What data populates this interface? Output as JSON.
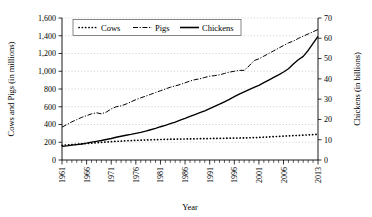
{
  "chart_data": {
    "type": "line",
    "title": "",
    "xlabel": "Year",
    "ylabel": "Cows and Pigs (in millions)",
    "y2label": "Chickens (in billions)",
    "xlim": [
      1961,
      2013
    ],
    "ylim": [
      0,
      1600
    ],
    "y2lim": [
      0,
      70
    ],
    "grid": true,
    "legend_position": "top-center-inside",
    "x_tick_labels": [
      "1961",
      "1966",
      "1971",
      "1976",
      "1981",
      "1986",
      "1991",
      "1996",
      "2001",
      "2006",
      "2013"
    ],
    "x_tick_values": [
      1961,
      1966,
      1971,
      1976,
      1981,
      1986,
      1991,
      1996,
      2001,
      2006,
      2013
    ],
    "y_tick_labels": [
      "0",
      "200",
      "400",
      "600",
      "800",
      "1,000",
      "1,200",
      "1,400",
      "1,600"
    ],
    "y_tick_values": [
      0,
      200,
      400,
      600,
      800,
      1000,
      1200,
      1400,
      1600
    ],
    "y2_tick_labels": [
      "0",
      "10",
      "20",
      "30",
      "40",
      "50",
      "60",
      "70"
    ],
    "y2_tick_values": [
      0,
      10,
      20,
      30,
      40,
      50,
      60,
      70
    ],
    "x": [
      1961,
      1962,
      1963,
      1964,
      1965,
      1966,
      1967,
      1968,
      1969,
      1970,
      1971,
      1972,
      1973,
      1974,
      1975,
      1976,
      1977,
      1978,
      1979,
      1980,
      1981,
      1982,
      1983,
      1984,
      1985,
      1986,
      1987,
      1988,
      1989,
      1990,
      1991,
      1992,
      1993,
      1994,
      1995,
      1996,
      1997,
      1998,
      1999,
      2000,
      2001,
      2002,
      2003,
      2004,
      2005,
      2006,
      2007,
      2008,
      2009,
      2010,
      2011,
      2012,
      2013
    ],
    "series": [
      {
        "name": "Cows",
        "axis": "left",
        "unit": "millions",
        "style": "dotted",
        "values": [
          166,
          170,
          174,
          178,
          182,
          186,
          190,
          194,
          198,
          202,
          206,
          210,
          213,
          216,
          219,
          221,
          223,
          225,
          227,
          229,
          231,
          233,
          234,
          235,
          236,
          237,
          238,
          239,
          240,
          241,
          242,
          243,
          244,
          245,
          246,
          247,
          248,
          249,
          250,
          252,
          254,
          257,
          260,
          263,
          266,
          269,
          272,
          275,
          277,
          280,
          283,
          286,
          289
        ]
      },
      {
        "name": "Pigs",
        "axis": "left",
        "unit": "millions",
        "style": "dash-dot",
        "values": [
          370,
          400,
          430,
          455,
          480,
          500,
          520,
          532,
          520,
          540,
          575,
          600,
          610,
          630,
          655,
          680,
          700,
          720,
          740,
          760,
          780,
          800,
          820,
          835,
          850,
          870,
          890,
          905,
          915,
          930,
          945,
          950,
          960,
          975,
          990,
          1000,
          1010,
          1010,
          1060,
          1120,
          1140,
          1170,
          1200,
          1230,
          1260,
          1290,
          1320,
          1340,
          1370,
          1395,
          1420,
          1445,
          1470
        ]
      },
      {
        "name": "Chickens",
        "axis": "right",
        "unit": "billions",
        "style": "solid",
        "values": [
          6.8,
          7.0,
          7.3,
          7.6,
          7.9,
          8.3,
          8.8,
          9.2,
          9.6,
          10.1,
          10.6,
          11.2,
          11.7,
          12.2,
          12.6,
          13.1,
          13.6,
          14.2,
          14.9,
          15.6,
          16.4,
          17.1,
          17.9,
          18.7,
          19.6,
          20.5,
          21.5,
          22.4,
          23.3,
          24.2,
          25.3,
          26.4,
          27.5,
          28.7,
          29.9,
          31.2,
          32.5,
          33.6,
          34.7,
          35.8,
          36.8,
          38.1,
          39.4,
          40.7,
          42.0,
          43.4,
          45.0,
          47.3,
          49.4,
          51.1,
          54.0,
          57.5,
          61.0
        ]
      }
    ]
  },
  "legend": {
    "items": [
      {
        "label": "Cows",
        "style": "dotted"
      },
      {
        "label": "Pigs",
        "style": "dash-dot"
      },
      {
        "label": "Chickens",
        "style": "solid"
      }
    ]
  }
}
